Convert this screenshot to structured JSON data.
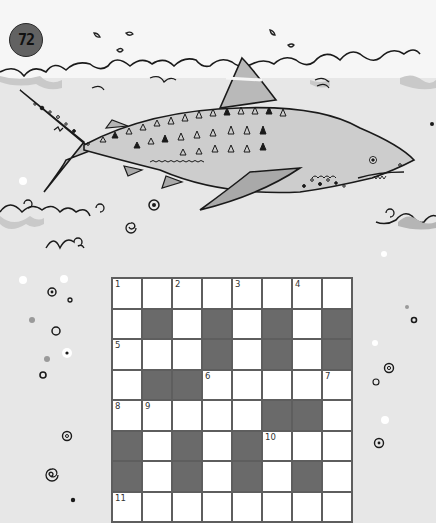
{
  "page": {
    "number": "72"
  },
  "colors": {
    "sky": "#f6f6f6",
    "sea": "#e7e7e7",
    "wave_fill": "#c9c9c9",
    "shark_body": "#cdcdcd",
    "shark_fin": "#b5b5b5",
    "pectoral_fin": "#a9a9a9",
    "grid_border": "#5e5e5e",
    "block_cell": "#6a6a6a",
    "open_cell": "#ffffff",
    "badge": "#626262"
  },
  "illustration": {
    "subject": "tiger-shark",
    "decorations": [
      "water-splash",
      "waves",
      "spiral-bubbles",
      "dot-bubbles"
    ]
  },
  "crossword": {
    "columns": 8,
    "rows_visible": 8,
    "grid": [
      [
        {
          "t": "o",
          "n": "1"
        },
        {
          "t": "o"
        },
        {
          "t": "o",
          "n": "2"
        },
        {
          "t": "o"
        },
        {
          "t": "o",
          "n": "3"
        },
        {
          "t": "o"
        },
        {
          "t": "o",
          "n": "4"
        },
        {
          "t": "o"
        }
      ],
      [
        {
          "t": "o"
        },
        {
          "t": "b"
        },
        {
          "t": "o"
        },
        {
          "t": "b"
        },
        {
          "t": "o"
        },
        {
          "t": "b"
        },
        {
          "t": "o"
        },
        {
          "t": "b"
        }
      ],
      [
        {
          "t": "o",
          "n": "5"
        },
        {
          "t": "o"
        },
        {
          "t": "o"
        },
        {
          "t": "b"
        },
        {
          "t": "o"
        },
        {
          "t": "b"
        },
        {
          "t": "o"
        },
        {
          "t": "b"
        }
      ],
      [
        {
          "t": "o"
        },
        {
          "t": "b"
        },
        {
          "t": "b"
        },
        {
          "t": "o",
          "n": "6"
        },
        {
          "t": "o"
        },
        {
          "t": "o"
        },
        {
          "t": "o"
        },
        {
          "t": "o",
          "n": "7"
        }
      ],
      [
        {
          "t": "o",
          "n": "8"
        },
        {
          "t": "o",
          "n": "9"
        },
        {
          "t": "o"
        },
        {
          "t": "o"
        },
        {
          "t": "o"
        },
        {
          "t": "b"
        },
        {
          "t": "b"
        },
        {
          "t": "o"
        }
      ],
      [
        {
          "t": "b"
        },
        {
          "t": "o"
        },
        {
          "t": "b"
        },
        {
          "t": "o"
        },
        {
          "t": "b"
        },
        {
          "t": "o",
          "n": "10"
        },
        {
          "t": "o"
        },
        {
          "t": "o"
        }
      ],
      [
        {
          "t": "b"
        },
        {
          "t": "o"
        },
        {
          "t": "b"
        },
        {
          "t": "o"
        },
        {
          "t": "b"
        },
        {
          "t": "o"
        },
        {
          "t": "b"
        },
        {
          "t": "o"
        }
      ],
      [
        {
          "t": "o",
          "n": "11"
        },
        {
          "t": "o"
        },
        {
          "t": "o"
        },
        {
          "t": "o"
        },
        {
          "t": "o"
        },
        {
          "t": "o"
        },
        {
          "t": "o"
        },
        {
          "t": "o"
        }
      ]
    ],
    "clue_numbers": [
      "1",
      "2",
      "3",
      "4",
      "5",
      "6",
      "7",
      "8",
      "9",
      "10",
      "11"
    ]
  }
}
